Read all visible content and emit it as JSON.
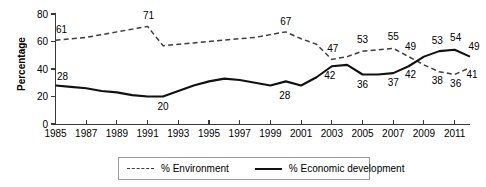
{
  "chart_data": {
    "type": "line",
    "title": "",
    "xlabel": "",
    "ylabel": "Percentage",
    "ylim": [
      0,
      80
    ],
    "yticks": [
      0,
      20,
      40,
      60,
      80
    ],
    "xlim": [
      1985,
      2012
    ],
    "xticks": [
      1985,
      1987,
      1989,
      1991,
      1993,
      1995,
      1997,
      1999,
      2001,
      2003,
      2005,
      2007,
      2009,
      2011
    ],
    "grid": false,
    "legend_position": "bottom-center",
    "x": [
      1985,
      1986,
      1987,
      1988,
      1989,
      1990,
      1991,
      1992,
      1993,
      1994,
      1995,
      1996,
      1997,
      1998,
      1999,
      2000,
      2001,
      2002,
      2003,
      2004,
      2005,
      2006,
      2007,
      2008,
      2009,
      2010,
      2011,
      2012
    ],
    "series": [
      {
        "name": "% Environment",
        "style": "dashed",
        "color": "#3d3d3d",
        "values": [
          61,
          62,
          63,
          65,
          67,
          69,
          71,
          57,
          58,
          59,
          60,
          61,
          62,
          63,
          65,
          67,
          62,
          58,
          47,
          49,
          53,
          54,
          55,
          49,
          43,
          38,
          36,
          41
        ]
      },
      {
        "name": "% Economic development",
        "style": "solid",
        "color": "#111111",
        "values": [
          28,
          27,
          26,
          24,
          23,
          21,
          20,
          20,
          24,
          28,
          31,
          33,
          32,
          30,
          28,
          31,
          28,
          34,
          42,
          43,
          36,
          36,
          37,
          42,
          49,
          53,
          54,
          49
        ]
      }
    ],
    "point_labels": [
      {
        "series": "% Environment",
        "x": 1985,
        "value": 61,
        "dx": 6,
        "dy": -7
      },
      {
        "series": "% Environment",
        "x": 1991,
        "value": 71,
        "dx": 1,
        "dy": -7
      },
      {
        "series": "% Environment",
        "x": 2000,
        "value": 67,
        "dx": 0,
        "dy": -7
      },
      {
        "series": "% Environment",
        "x": 2003,
        "value": 47,
        "dx": 1,
        "dy": -7
      },
      {
        "series": "% Environment",
        "x": 2005,
        "value": 53,
        "dx": 0,
        "dy": -8
      },
      {
        "series": "% Environment",
        "x": 2007,
        "value": 55,
        "dx": 0,
        "dy": -8
      },
      {
        "series": "% Environment",
        "x": 2008,
        "value": 49,
        "dx": 2,
        "dy": -7
      },
      {
        "series": "% Environment",
        "x": 2010,
        "value": 38,
        "dx": -2,
        "dy": 12
      },
      {
        "series": "% Environment",
        "x": 2011,
        "value": 36,
        "dx": 1,
        "dy": 12
      },
      {
        "series": "% Environment",
        "x": 2012,
        "value": 41,
        "dx": 2,
        "dy": 10
      },
      {
        "series": "% Economic development",
        "x": 1985,
        "value": 28,
        "dx": 7,
        "dy": -6
      },
      {
        "series": "% Economic development",
        "x": 1992,
        "value": 20,
        "dx": 0,
        "dy": 13
      },
      {
        "series": "% Economic development",
        "x": 2000,
        "value": 28,
        "dx": -1,
        "dy": 13
      },
      {
        "series": "% Economic development",
        "x": 2003,
        "value": 42,
        "dx": -2,
        "dy": 13
      },
      {
        "series": "% Economic development",
        "x": 2005,
        "value": 36,
        "dx": 0,
        "dy": 13
      },
      {
        "series": "% Economic development",
        "x": 2007,
        "value": 37,
        "dx": 0,
        "dy": 13
      },
      {
        "series": "% Economic development",
        "x": 2008,
        "value": 42,
        "dx": 2,
        "dy": 12
      },
      {
        "series": "% Economic development",
        "x": 2010,
        "value": 53,
        "dx": -2,
        "dy": -7
      },
      {
        "series": "% Economic development",
        "x": 2011,
        "value": 54,
        "dx": 1,
        "dy": -9
      },
      {
        "series": "% Economic development",
        "x": 2012,
        "value": 49,
        "dx": 4,
        "dy": -7
      }
    ]
  },
  "legend": {
    "entries": [
      {
        "label": "% Environment",
        "style": "dashed"
      },
      {
        "label": "% Economic development",
        "style": "solid"
      }
    ]
  },
  "axis": {
    "y_title": "Percentage"
  }
}
